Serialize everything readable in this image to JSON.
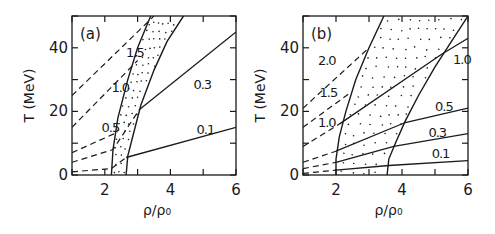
{
  "chart_data": [
    {
      "type": "line",
      "panel_label": "(a)",
      "xlabel": "ρ/ρ₀",
      "ylabel": "T (MeV)",
      "xlim": [
        1,
        6
      ],
      "ylim": [
        0,
        50
      ],
      "xticks": [
        2,
        4,
        6
      ],
      "yticks": [
        0,
        20,
        40
      ],
      "xticks_minor": [
        1,
        2,
        3,
        4,
        5,
        6
      ],
      "yticks_minor": [
        0,
        10,
        20,
        30,
        40,
        50
      ],
      "grid": false,
      "region": {
        "name": "coexistence-band",
        "style": "dotted",
        "left_boundary": [
          [
            2.2,
            0
          ],
          [
            2.25,
            8
          ],
          [
            2.4,
            18
          ],
          [
            2.7,
            30
          ],
          [
            3.0,
            40
          ],
          [
            3.4,
            50
          ]
        ],
        "right_boundary": [
          [
            2.65,
            0
          ],
          [
            2.7,
            6
          ],
          [
            2.9,
            14
          ],
          [
            3.1,
            22
          ],
          [
            3.5,
            33
          ],
          [
            3.9,
            42
          ],
          [
            4.4,
            50
          ]
        ]
      },
      "series": [
        {
          "name": "0.1",
          "label_at": [
            4.8,
            13
          ],
          "dashed": [
            [
              1,
              1
            ],
            [
              2.2,
              2
            ],
            [
              2.65,
              5.5
            ]
          ],
          "solid": [
            [
              2.65,
              5.5
            ],
            [
              6,
              15
            ]
          ]
        },
        {
          "name": "0.3",
          "label_at": [
            4.7,
            27
          ],
          "dashed": [
            [
              1,
              4
            ],
            [
              2.25,
              8
            ],
            [
              3.05,
              20.5
            ]
          ],
          "solid": [
            [
              3.05,
              20.5
            ],
            [
              6,
              45
            ]
          ]
        },
        {
          "name": "0.5",
          "label_at": [
            1.9,
            13.5
          ],
          "dashed": [
            [
              1,
              7
            ],
            [
              2.4,
              13.5
            ]
          ],
          "solid": []
        },
        {
          "name": "1.0",
          "label_at": [
            2.2,
            26
          ],
          "dashed": [
            [
              1,
              15
            ],
            [
              3.0,
              36
            ]
          ],
          "solid": []
        },
        {
          "name": "1.5",
          "label_at": [
            2.65,
            37
          ],
          "dashed": [
            [
              1,
              25
            ],
            [
              3.5,
              50
            ]
          ],
          "solid": []
        }
      ]
    },
    {
      "type": "line",
      "panel_label": "(b)",
      "xlabel": "ρ/ρ₀",
      "ylabel": "T (MeV)",
      "xlim": [
        1,
        6
      ],
      "ylim": [
        0,
        50
      ],
      "xticks": [
        2,
        4,
        6
      ],
      "yticks": [
        0,
        20,
        40
      ],
      "xticks_minor": [
        1,
        2,
        3,
        4,
        5,
        6
      ],
      "yticks_minor": [
        0,
        10,
        20,
        30,
        40,
        50
      ],
      "grid": false,
      "region": {
        "name": "coexistence-band",
        "style": "dotted",
        "left_boundary": [
          [
            2.0,
            0
          ],
          [
            2.0,
            5
          ],
          [
            2.1,
            12
          ],
          [
            2.3,
            20
          ],
          [
            2.6,
            30
          ],
          [
            3.0,
            40
          ],
          [
            3.45,
            50
          ]
        ],
        "right_boundary": [
          [
            3.55,
            0
          ],
          [
            3.6,
            5
          ],
          [
            3.8,
            10
          ],
          [
            4.1,
            17
          ],
          [
            4.5,
            25
          ],
          [
            5.0,
            34
          ],
          [
            5.5,
            42
          ],
          [
            6.0,
            50
          ]
        ]
      },
      "series": [
        {
          "name": "0.1",
          "label_at": [
            4.9,
            5.5
          ],
          "dashed": [
            [
              1,
              0.5
            ],
            [
              2.0,
              1.5
            ]
          ],
          "solid": [
            [
              2.0,
              1.5
            ],
            [
              3.6,
              3
            ],
            [
              6,
              4.5
            ]
          ]
        },
        {
          "name": "0.3",
          "label_at": [
            4.8,
            12
          ],
          "dashed": [
            [
              1,
              2
            ],
            [
              2.0,
              4
            ]
          ],
          "solid": [
            [
              2.0,
              4
            ],
            [
              3.75,
              9
            ],
            [
              6,
              13
            ]
          ]
        },
        {
          "name": "0.5",
          "label_at": [
            5.0,
            20
          ],
          "dashed": [
            [
              1,
              4
            ],
            [
              2.0,
              7.5
            ]
          ],
          "solid": [
            [
              2.0,
              7.5
            ],
            [
              4.1,
              16.5
            ],
            [
              6,
              21
            ]
          ]
        },
        {
          "name": "1.0",
          "label_at": [
            5.55,
            35
          ],
          "dashed": [
            [
              1,
              9
            ],
            [
              2.1,
              16
            ]
          ],
          "solid": [
            [
              2.1,
              16
            ],
            [
              5.2,
              38
            ],
            [
              6,
              43
            ]
          ]
        },
        {
          "name": "1.0",
          "label_at": [
            1.45,
            15
          ],
          "dashed": [],
          "solid": [],
          "label_only": true
        },
        {
          "name": "1.5",
          "label_at": [
            1.5,
            24.5
          ],
          "dashed": [
            [
              1,
              15
            ],
            [
              2.45,
              26
            ]
          ],
          "solid": []
        },
        {
          "name": "2.0",
          "label_at": [
            1.45,
            34.5
          ],
          "dashed": [
            [
              1,
              21
            ],
            [
              3.0,
              40
            ]
          ],
          "solid": []
        }
      ]
    }
  ]
}
